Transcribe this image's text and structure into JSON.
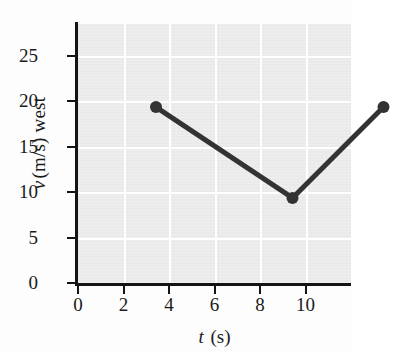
{
  "chart_data": {
    "type": "line",
    "title": "",
    "subtitle": "",
    "xlabel": "t (s)",
    "xlabel_variable": "t",
    "xlabel_unit": "(s)",
    "ylabel": "v (m/s) west",
    "ylabel_variable": "v",
    "ylabel_unit": "(m/s) west",
    "x": [
      0,
      6,
      10
    ],
    "values": [
      22,
      12,
      22
    ],
    "points": [
      {
        "x": 0,
        "y": 22
      },
      {
        "x": 6,
        "y": 12
      },
      {
        "x": 10,
        "y": 22
      }
    ],
    "series": [
      {
        "name": "velocity",
        "x": [
          0,
          6,
          10
        ],
        "values": [
          22,
          12,
          22
        ]
      }
    ],
    "xlim": [
      0,
      12
    ],
    "ylim": [
      0,
      28.5
    ],
    "xticks": [
      0,
      2,
      4,
      6,
      8,
      10
    ],
    "xtick_labels": [
      "0",
      "2",
      "4",
      "6",
      "8",
      "10"
    ],
    "yticks": [
      0,
      5,
      10,
      15,
      20,
      25
    ],
    "ytick_labels": [
      "0",
      "5",
      "10",
      "15",
      "20",
      "25"
    ],
    "grid": true,
    "grid_color": "#ffffff",
    "plot_background": "#ebebeb",
    "line_color": "#333333",
    "marker_color": "#333333",
    "marker": "circle",
    "legend": false,
    "legend_position": "none"
  },
  "figure": {
    "axis_color": "#141414",
    "page_background": "#fdfdfd"
  }
}
